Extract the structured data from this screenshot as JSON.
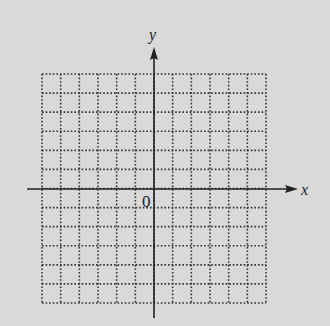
{
  "diagram": {
    "type": "coordinate-grid",
    "x_axis_label": "x",
    "y_axis_label": "y",
    "origin_label": "0",
    "grid": {
      "columns": 12,
      "rows": 12,
      "x_min": -6,
      "x_max": 6,
      "y_min": -6,
      "y_max": 6,
      "line_style": "dotted"
    },
    "colors": {
      "background": "#d9d9d9",
      "axis": "#222222",
      "grid": "#333333"
    }
  }
}
